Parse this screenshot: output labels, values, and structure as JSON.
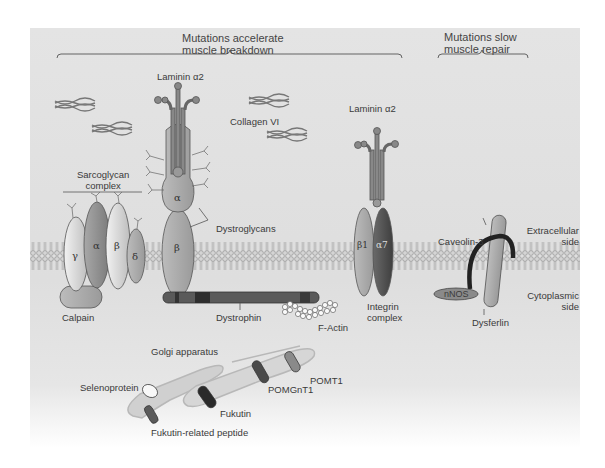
{
  "headers": {
    "left": [
      "Mutations accelerate",
      "muscle breakdown"
    ],
    "right": [
      "Mutations slow",
      "muscle repair"
    ]
  },
  "labels": {
    "laminin_left": "Laminin α2",
    "laminin_right": "Laminin α2",
    "collagen": "Collagen VI",
    "sarcoglycan": [
      "Sarcoglycan",
      "complex"
    ],
    "dystroglycans": "Dystroglycans",
    "calpain": "Calpain",
    "dystrophin": "Dystrophin",
    "f_actin": "F-Actin",
    "integrin": [
      "Integrin",
      "complex"
    ],
    "caveolin": "Caveolin-3",
    "nnos": "nNOS",
    "dysferlin": "Dysferlin",
    "extracellular": [
      "Extracellular",
      "side"
    ],
    "cytoplasmic": [
      "Cytoplasmic",
      "side"
    ],
    "golgi": "Golgi apparatus",
    "selenoprotein": "Selenoprotein",
    "fukutin": "Fukutin",
    "fukutin_related": "Fukutin-related peptide",
    "pomgnt1": "POMGnT1",
    "pomt1": "POMT1"
  },
  "subunits": {
    "sg_gamma": "γ",
    "sg_alpha": "α",
    "sg_beta": "β",
    "sg_delta": "δ",
    "dg_alpha": "α",
    "dg_beta": "β",
    "int_beta1": "β1",
    "int_alpha7": "α7"
  },
  "colors": {
    "background": "#e0e0e0",
    "membrane_head": "#cfcfcf",
    "dark_protein": "#4a4a4a",
    "mid_protein": "#8f8f8f",
    "light_protein": "#c9c9c9"
  }
}
